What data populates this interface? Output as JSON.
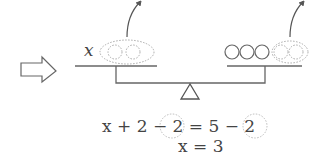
{
  "diagram": {
    "left_pan_label": "x",
    "left_pan_removed_weights": 2,
    "right_pan_weights": 3,
    "right_pan_removed_weights": 2,
    "equation_line1": {
      "lhs": "x + 2",
      "lhs_removed": "− 2",
      "eq": "=",
      "rhs": "5",
      "rhs_removed": "− 2"
    },
    "equation_line2": "x = 3",
    "colors": {
      "stroke": "#555555",
      "dotted": "#999999"
    }
  }
}
